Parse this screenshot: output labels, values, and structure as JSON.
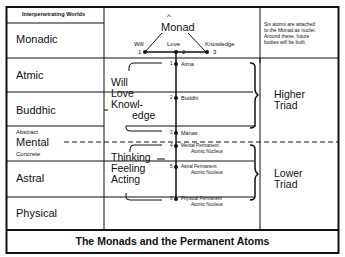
{
  "diagram": {
    "title": "The Monads and the Permanent Atoms",
    "column_header": "Interpenetrating Worlds",
    "worlds": [
      {
        "name": "Monadic"
      },
      {
        "name": "Atmic"
      },
      {
        "name": "Buddhic"
      },
      {
        "name": "Mental",
        "upper": "Abstract",
        "lower": "Concrete"
      },
      {
        "name": "Astral"
      },
      {
        "name": "Physical"
      }
    ],
    "monad": {
      "label": "Monad",
      "aspects": [
        {
          "number": "1",
          "label": "Will"
        },
        {
          "number": "2",
          "label": "Love"
        },
        {
          "number": "3",
          "label": "Knowledge"
        }
      ]
    },
    "atoms": [
      {
        "number": "1",
        "label": "Atma"
      },
      {
        "number": "2",
        "label": "Buddhi"
      },
      {
        "number": "3",
        "label": "Manas"
      },
      {
        "number": "4",
        "label_line1": "Mental Permanent",
        "label_line2": "Atomic Nucleus"
      },
      {
        "number": "5",
        "label_line1": "Astral Permanent",
        "label_line2": "Atomic Nucleus"
      },
      {
        "number": "6",
        "label_line1": "Physical Permanent",
        "label_line2": "Atomic Nucleus"
      }
    ],
    "higher_qualities": [
      "Will",
      "Love",
      "Knowl-",
      "edge"
    ],
    "lower_qualities": [
      "Thinking",
      "Feeling",
      "Acting"
    ],
    "higher_triad": [
      "Higher",
      "Triad"
    ],
    "lower_triad": [
      "Lower",
      "Triad"
    ],
    "note": [
      "Six atoms are attached",
      "to the Monad as nuclei.",
      "Around these, future",
      "bodies will be built."
    ]
  }
}
